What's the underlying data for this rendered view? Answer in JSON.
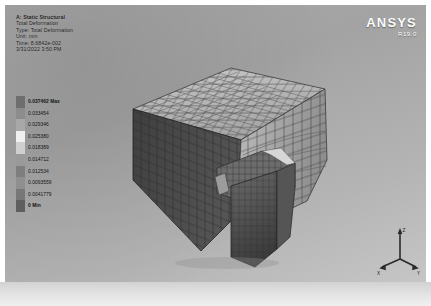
{
  "viewport": {
    "background_color": "#a9a9a9"
  },
  "header": {
    "analysis": "A: Static Structural",
    "result": "Total Deformation",
    "type_line": "Type: Total Deformation",
    "unit_line": "Unit: mm",
    "time_line": "Time: 8.6842e-002",
    "timestamp": "3/31/2022 3:50 PM"
  },
  "logo": {
    "brand": "ANSYS",
    "release": "R19.0"
  },
  "legend": {
    "title_suffix": "Max",
    "min_suffix": "Min",
    "bands": [
      {
        "value": "0.037462",
        "suffix": "Max",
        "color": "#6e6e6e"
      },
      {
        "value": "0.033454",
        "suffix": "",
        "color": "#8c8c8c"
      },
      {
        "value": "0.029346",
        "suffix": "",
        "color": "#a8a8a8"
      },
      {
        "value": "0.025380",
        "suffix": "",
        "color": "#f0f0f0"
      },
      {
        "value": "0.018389",
        "suffix": "",
        "color": "#cfcfcf"
      },
      {
        "value": "0.014712",
        "suffix": "",
        "color": "#9a9a9a"
      },
      {
        "value": "0.012534",
        "suffix": "",
        "color": "#7e7e7e"
      },
      {
        "value": "0.0093559",
        "suffix": "",
        "color": "#8f8f8f"
      },
      {
        "value": "0.0041779",
        "suffix": "",
        "color": "#777777"
      },
      {
        "value": "0",
        "suffix": "Min",
        "color": "#5e5e5e"
      }
    ]
  },
  "model": {
    "description": "Meshed soil block with embedded footing, total deformation contour",
    "mesh_line_color": "#3b3b3b"
  },
  "triad": {
    "axes": [
      {
        "name": "z-axis",
        "label": "Z"
      },
      {
        "name": "x-axis",
        "label": "X"
      },
      {
        "name": "y-axis",
        "label": "Y"
      }
    ]
  }
}
